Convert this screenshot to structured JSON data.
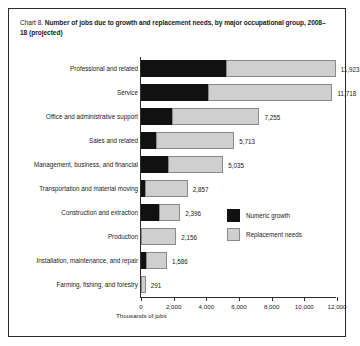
{
  "title": {
    "prefix": "Chart 8.",
    "main": "Number of jobs due to growth and replacement needs, by major occupational group, 2008–18 (projected)"
  },
  "axis_title": "Thousands of jobs",
  "legend": {
    "items": [
      {
        "label": "Numeric growth",
        "color": "#111111"
      },
      {
        "label": "Replacement needs",
        "color": "#cfcfcf"
      }
    ]
  },
  "chart_data": {
    "type": "bar",
    "orientation": "horizontal",
    "stacked": true,
    "title": "Chart 8. Number of jobs due to growth and replacement needs, by major occupational group, 2008–18 (projected)",
    "xlabel": "Thousands of jobs",
    "ylabel": "",
    "xlim": [
      0,
      12000
    ],
    "xticks": [
      0,
      2000,
      4000,
      6000,
      8000,
      10000,
      12000
    ],
    "xtick_labels": [
      "0",
      "2,000",
      "4,000",
      "6,000",
      "8,000",
      "10,000",
      "12,000"
    ],
    "grid": false,
    "legend_position": "inside-right",
    "categories": [
      "Professional and related",
      "Service",
      "Office and administrative support",
      "Sales and related",
      "Management, business, and financial",
      "Transportation and material moving",
      "Construction and extraction",
      "Production",
      "Installation, maintenance, and repair",
      "Farming, fishing, and forestry"
    ],
    "series": [
      {
        "name": "Numeric growth",
        "color": "#111111",
        "values": [
          5200,
          4100,
          1900,
          900,
          1650,
          250,
          1100,
          0,
          300,
          0
        ]
      },
      {
        "name": "Replacement needs",
        "color": "#cfcfcf",
        "values": [
          6723,
          7618,
          5355,
          4813,
          3385,
          2607,
          1296,
          2156,
          1286,
          291
        ]
      }
    ],
    "totals": [
      11923,
      11718,
      7255,
      5713,
      5035,
      2857,
      2396,
      2156,
      1586,
      291
    ],
    "total_labels": [
      "11,923",
      "11,718",
      "7,255",
      "5,713",
      "5,035",
      "2,857",
      "2,396",
      "2,156",
      "1,586",
      "291"
    ]
  }
}
